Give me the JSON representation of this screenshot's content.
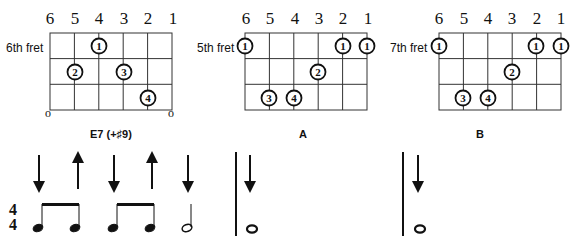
{
  "string_numbers": [
    "6",
    "5",
    "4",
    "3",
    "2",
    "1"
  ],
  "chords": [
    {
      "name": "E7 (+♯9)",
      "fret_label": "6th fret",
      "open_markers": [
        "o",
        "o"
      ],
      "fingers": [
        {
          "string": 4,
          "fret": 1,
          "finger": "1"
        },
        {
          "string": 5,
          "fret": 2,
          "finger": "2"
        },
        {
          "string": 3,
          "fret": 2,
          "finger": "3"
        },
        {
          "string": 2,
          "fret": 3,
          "finger": "4"
        }
      ]
    },
    {
      "name": "A",
      "fret_label": "5th fret",
      "fingers": [
        {
          "string": 6,
          "fret": 1,
          "finger": "1"
        },
        {
          "string": 2,
          "fret": 1,
          "finger": "1"
        },
        {
          "string": 1,
          "fret": 1,
          "finger": "1"
        },
        {
          "string": 3,
          "fret": 2,
          "finger": "2"
        },
        {
          "string": 5,
          "fret": 3,
          "finger": "3"
        },
        {
          "string": 4,
          "fret": 3,
          "finger": "4"
        }
      ]
    },
    {
      "name": "B",
      "fret_label": "7th fret",
      "fingers": [
        {
          "string": 6,
          "fret": 1,
          "finger": "1"
        },
        {
          "string": 2,
          "fret": 1,
          "finger": "1"
        },
        {
          "string": 1,
          "fret": 1,
          "finger": "1"
        },
        {
          "string": 3,
          "fret": 2,
          "finger": "2"
        },
        {
          "string": 5,
          "fret": 3,
          "finger": "3"
        },
        {
          "string": 4,
          "fret": 3,
          "finger": "4"
        }
      ]
    }
  ],
  "rhythm": {
    "time_signature": {
      "top": "4",
      "bottom": "4"
    },
    "measure1_strums": [
      "down",
      "up",
      "down",
      "up",
      "down"
    ],
    "measure1_notes": [
      "eighth",
      "eighth",
      "eighth",
      "eighth",
      "half"
    ],
    "measure2_strums": [
      "down"
    ],
    "measure2_notes": [
      "whole"
    ],
    "measure3_strums": [
      "down"
    ],
    "measure3_notes": [
      "whole"
    ]
  }
}
